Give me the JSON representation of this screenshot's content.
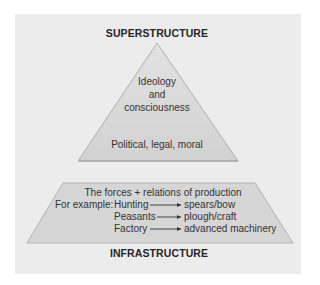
{
  "diagram": {
    "superstructure": {
      "title": "SUPERSTRUCTURE",
      "line1": "Ideology",
      "line2": "and",
      "line3": "consciousness",
      "line4": "Political, legal, moral"
    },
    "infrastructure": {
      "title": "INFRASTRUCTURE",
      "header": "The forces + relations of production",
      "example_prefix": "For example:",
      "rows": [
        {
          "from": "Hunting",
          "to": "spears/bow"
        },
        {
          "from": "Peasants",
          "to": "plough/craft"
        },
        {
          "from": "Factory",
          "to": "advanced machinery"
        }
      ]
    },
    "colors": {
      "panel": "#ececec",
      "shape_fill": "#d7d7d7",
      "shape_edge": "#a8a8a8",
      "text": "#2a2a2a"
    }
  }
}
